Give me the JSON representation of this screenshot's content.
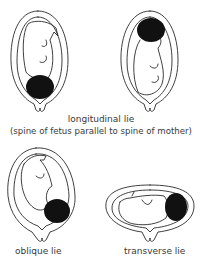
{
  "diagram": {
    "colors": {
      "line": "#2a2a2a",
      "head_fill": "#111111",
      "background": "#ffffff"
    },
    "figures": [
      {
        "id": "longitudinal-cephalic",
        "head_position": "bottom"
      },
      {
        "id": "longitudinal-breech",
        "head_position": "top"
      },
      {
        "id": "oblique",
        "head_position": "lower-right"
      },
      {
        "id": "transverse",
        "head_position": "right"
      }
    ],
    "captions": {
      "longitudinal": "longitudinal lie",
      "longitudinal_note": "(spine of fetus parallel to spine of mother)",
      "oblique": "oblique lie",
      "transverse": "transverse lie"
    }
  }
}
